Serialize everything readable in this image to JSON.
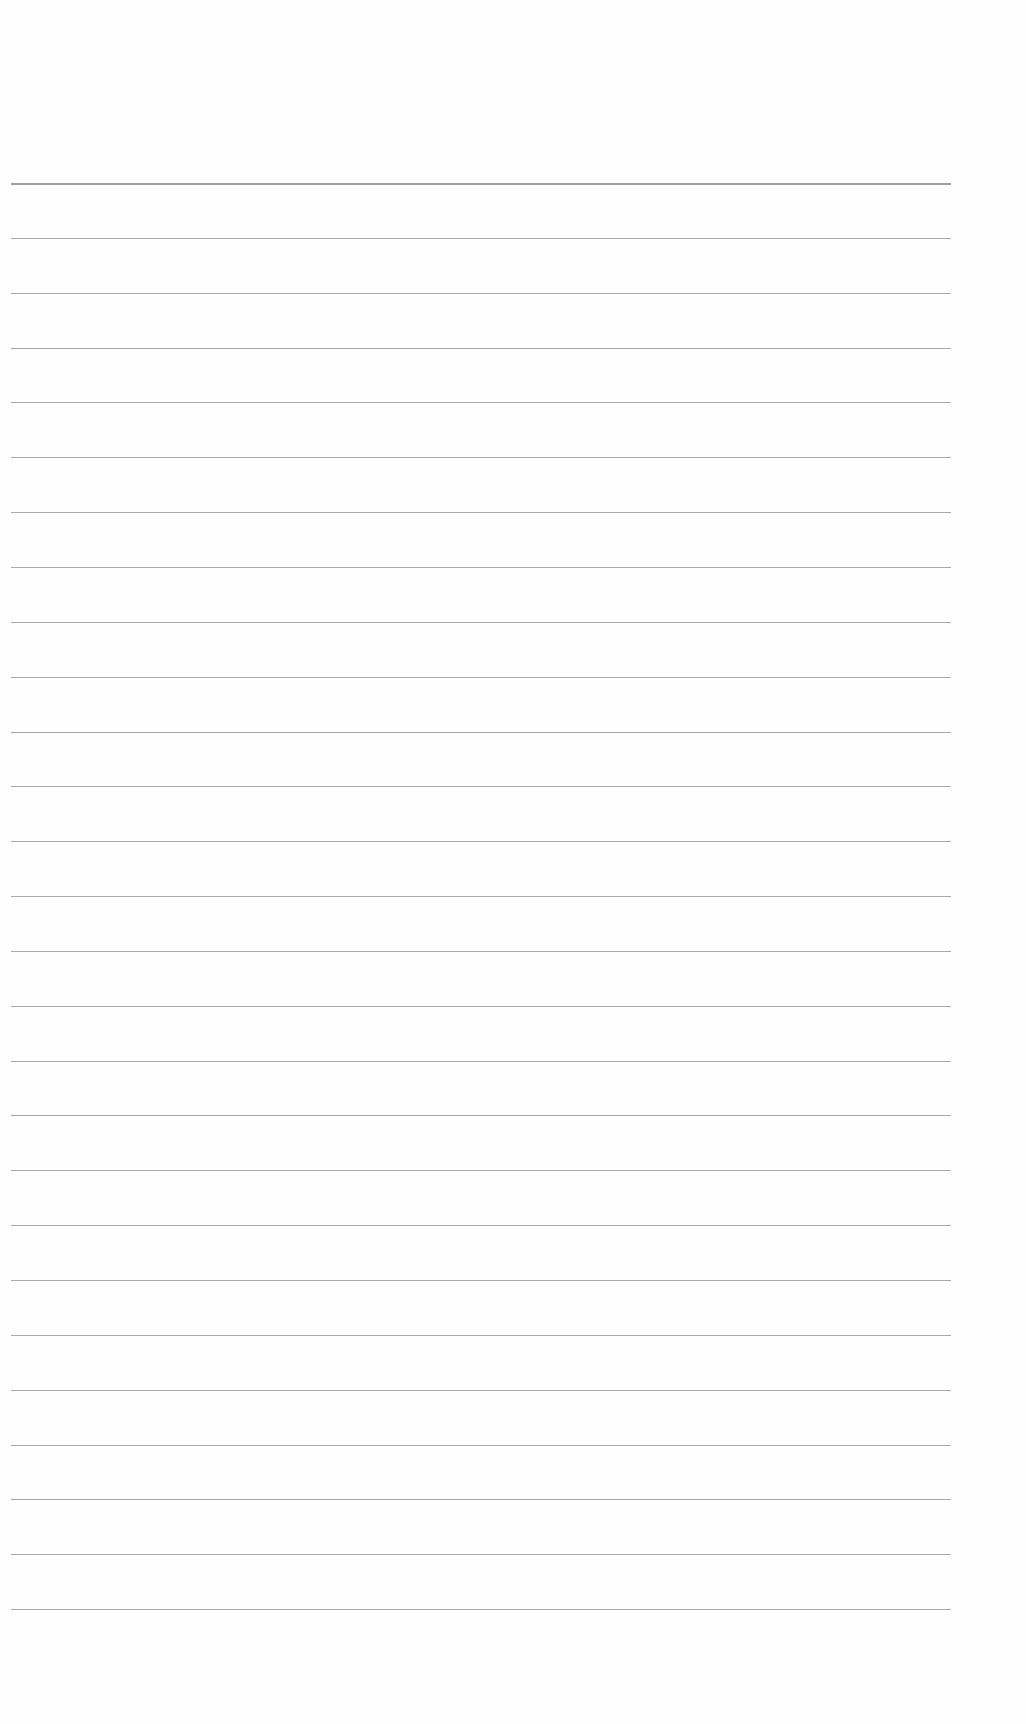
{
  "document": {
    "type": "lined-paper",
    "background_color": "#fefefe",
    "line_color": "#9a9a9a",
    "line_count": 27,
    "first_line_y": 183,
    "line_spacing": 54.85,
    "line_left_x": 11,
    "line_width": 940,
    "lines": []
  }
}
